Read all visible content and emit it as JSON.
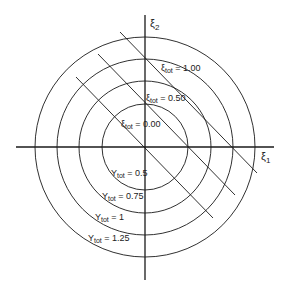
{
  "diagram": {
    "colors": {
      "line": "#1a1a1a",
      "background": "#ffffff",
      "text": "#222222"
    },
    "center": {
      "x": 145,
      "y": 147
    },
    "axes": {
      "x": {
        "label": "ξ",
        "subscript": "1",
        "from": 16,
        "to": 274
      },
      "y": {
        "label": "ξ",
        "subscript": "2",
        "from": 15,
        "to": 280
      }
    },
    "circles": [
      {
        "radius": 43,
        "label_base": "Y",
        "label_sub": "tot",
        "label_value": " = 0.5"
      },
      {
        "radius": 66,
        "label_base": "Y",
        "label_sub": "tot",
        "label_value": " = 0.75"
      },
      {
        "radius": 88,
        "label_base": "Y",
        "label_sub": "tot",
        "label_value": " = 1"
      },
      {
        "radius": 110,
        "label_base": "Y",
        "label_sub": "tot",
        "label_value": " = 1.25"
      }
    ],
    "lines": [
      {
        "label_base": "ξ",
        "label_sub": "tot",
        "label_value": " = 0.00",
        "x1": 76,
        "y1": 77,
        "x2": 213,
        "y2": 218
      },
      {
        "label_base": "ξ",
        "label_sub": "tot",
        "label_value": " = 0.50",
        "x1": 98,
        "y1": 54,
        "x2": 235,
        "y2": 195
      },
      {
        "label_base": "ξ",
        "label_sub": "tot",
        "label_value": " = 1.00",
        "x1": 120,
        "y1": 32,
        "x2": 257,
        "y2": 173
      }
    ]
  }
}
